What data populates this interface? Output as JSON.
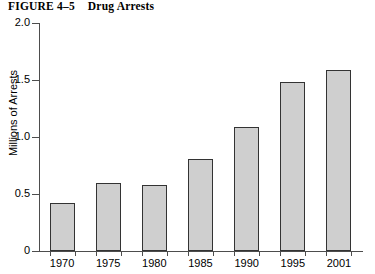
{
  "figure": {
    "number_label": "FIGURE 4–5",
    "title": "Drug Arrests"
  },
  "chart_data": {
    "type": "bar",
    "title": "Drug Arrests",
    "categories": [
      "1970",
      "1975",
      "1980",
      "1985",
      "1990",
      "1995",
      "2001"
    ],
    "values": [
      0.42,
      0.6,
      0.58,
      0.81,
      1.09,
      1.48,
      1.59
    ],
    "xlabel": "",
    "ylabel": "Millions of Arrests",
    "ylim": [
      0,
      2.0
    ],
    "ytick_labels": [
      "0",
      "0.5",
      "1.0",
      "1.5",
      "2.0"
    ],
    "ytick_values": [
      0,
      0.5,
      1.0,
      1.5,
      2.0
    ],
    "grid": false,
    "legend": null,
    "bar_fill_color": "#cfcfcf",
    "bar_border_color": "#333333",
    "axis_color": "#4d4d4d",
    "background_color": "#ffffff"
  }
}
